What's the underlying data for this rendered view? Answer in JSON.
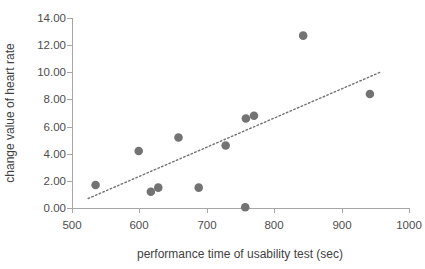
{
  "chart_data": {
    "type": "scatter",
    "title": "",
    "xlabel": "performance time of usability test (sec)",
    "ylabel": "change value of heart rate",
    "xlim": [
      500,
      1000
    ],
    "ylim": [
      0,
      14
    ],
    "xticks": [
      500,
      600,
      700,
      800,
      900,
      1000
    ],
    "yticks": [
      0,
      2,
      4,
      6,
      8,
      10,
      12,
      14
    ],
    "xtick_labels": [
      "500",
      "600",
      "700",
      "800",
      "900",
      "1000"
    ],
    "ytick_labels": [
      "0.00",
      "2.00",
      "4.00",
      "6.00",
      "8.00",
      "10.00",
      "12.00",
      "14.00"
    ],
    "grid": false,
    "legend": false,
    "marker_color": "#737373",
    "axis_color": "#a6a6a6",
    "text_color": "#4d4d4d",
    "points": [
      {
        "x": 535,
        "y": 1.7
      },
      {
        "x": 599,
        "y": 4.2
      },
      {
        "x": 617,
        "y": 1.2
      },
      {
        "x": 628,
        "y": 1.5
      },
      {
        "x": 658,
        "y": 5.2
      },
      {
        "x": 688,
        "y": 1.5
      },
      {
        "x": 728,
        "y": 4.6
      },
      {
        "x": 757,
        "y": 0.05
      },
      {
        "x": 758,
        "y": 6.6
      },
      {
        "x": 770,
        "y": 6.8
      },
      {
        "x": 843,
        "y": 12.7
      },
      {
        "x": 942,
        "y": 8.4
      }
    ],
    "trendline": {
      "style": "dotted",
      "x_start": 524,
      "y_start": 0.7,
      "x_end": 957,
      "y_end": 10.0
    }
  }
}
